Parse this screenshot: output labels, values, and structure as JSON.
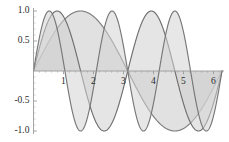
{
  "chart_data": {
    "type": "line",
    "title": "",
    "xlabel": "",
    "ylabel": "",
    "xlim": [
      0,
      6.2832
    ],
    "ylim": [
      -1.0,
      1.0
    ],
    "grid": false,
    "legend": "none",
    "filled": true,
    "fill_to": 0,
    "xticks": [
      1,
      2,
      3,
      4,
      5,
      6
    ],
    "xtick_labels": [
      "1",
      "2",
      "3",
      "4",
      "5",
      "6"
    ],
    "yticks": [
      -1.0,
      -0.5,
      0.5,
      1.0
    ],
    "ytick_labels": [
      "-1.0",
      "-0.5",
      "0.5",
      "1.0"
    ],
    "minor_tick_count": 4,
    "axis_position": 0,
    "series": [
      {
        "name": "sin(x)",
        "frequency": 1,
        "amplitude": 1.0,
        "stroke": "#7d7d7d",
        "fill": "#c9c9c9",
        "peaks": [
          {
            "x": 1.5708,
            "y": 1.0
          }
        ],
        "troughs": [
          {
            "x": 4.7124,
            "y": -1.0
          }
        ],
        "zeros": [
          0,
          3.1416,
          6.2832
        ]
      },
      {
        "name": "sin(2x)",
        "frequency": 2,
        "amplitude": 1.0,
        "stroke": "#6e6e6e",
        "fill": "#cfcfcf",
        "peaks": [
          {
            "x": 0.7854,
            "y": 1.0
          },
          {
            "x": 3.927,
            "y": 1.0
          }
        ],
        "troughs": [
          {
            "x": 2.3562,
            "y": -1.0
          },
          {
            "x": 5.4978,
            "y": -1.0
          }
        ],
        "zeros": [
          0,
          1.5708,
          3.1416,
          4.7124,
          6.2832
        ]
      },
      {
        "name": "sin(3x)",
        "frequency": 3,
        "amplitude": 1.0,
        "stroke": "#777777",
        "fill": "#d4d4d4",
        "peaks": [
          {
            "x": 0.5236,
            "y": 1.0
          },
          {
            "x": 2.618,
            "y": 1.0
          },
          {
            "x": 4.7124,
            "y": 1.0
          }
        ],
        "troughs": [
          {
            "x": 1.5708,
            "y": -1.0
          },
          {
            "x": 3.6652,
            "y": -1.0
          },
          {
            "x": 5.7596,
            "y": -1.0
          }
        ],
        "zeros": [
          0,
          1.0472,
          2.0944,
          3.1416,
          4.1888,
          5.236,
          6.2832
        ]
      }
    ],
    "colors": {
      "axis": "#9a9a9a",
      "tick": "#9a9a9a",
      "label": "#2b2b2b",
      "background": "#ffffff"
    }
  }
}
